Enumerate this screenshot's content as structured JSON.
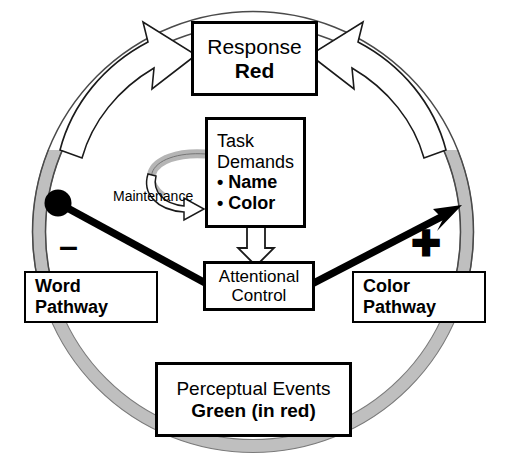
{
  "figure": {
    "type": "diagram"
  },
  "colors": {
    "outline": "#000000",
    "ring_gray": "#BFBFBF",
    "ring_gray_edge": "#8A8A8A",
    "background": "#FFFFFF"
  },
  "nodes": {
    "response": {
      "label": "Response",
      "value": "Red"
    },
    "task_demands": {
      "label_line1": "Task",
      "label_line2": "Demands",
      "bullets": [
        "Name",
        "Color"
      ],
      "bullet_glyph": "•"
    },
    "attentional_control": {
      "label_line1": "Attentional",
      "label_line2": "Control"
    },
    "word_pathway": {
      "label_line1": "Word",
      "label_line2": "Pathway"
    },
    "color_pathway": {
      "label_line1": "Color",
      "label_line2": "Pathway"
    },
    "perceptual_events": {
      "label": "Perceptual Events",
      "value": "Green (in red)"
    }
  },
  "annotations": {
    "maintenance": "Maintenance",
    "inhibitory_sign": "–",
    "excitatory_sign": "✚"
  },
  "connections": [
    {
      "name": "word-pathway-to-response",
      "from": "Perceptual Events",
      "to": "Response",
      "style": "hollow-curved-arrow",
      "side": "left"
    },
    {
      "name": "color-pathway-to-response",
      "from": "Perceptual Events",
      "to": "Response",
      "style": "hollow-curved-arrow",
      "side": "right"
    },
    {
      "name": "task-demands-to-attentional-control",
      "from": "Task Demands",
      "to": "Attentional Control",
      "style": "hollow-block-arrow-down"
    },
    {
      "name": "attentional-control-inhibits-word-pathway",
      "from": "Attentional Control",
      "to": "Word Pathway",
      "style": "ball-ended-line",
      "sign": "minus"
    },
    {
      "name": "attentional-control-excites-color-pathway",
      "from": "Attentional Control",
      "to": "Color Pathway",
      "style": "solid-arrow",
      "sign": "plus"
    },
    {
      "name": "maintenance-loop",
      "from": "Task Demands",
      "to": "Task Demands",
      "style": "gray-curved-loop-arrow",
      "label": "Maintenance"
    }
  ]
}
